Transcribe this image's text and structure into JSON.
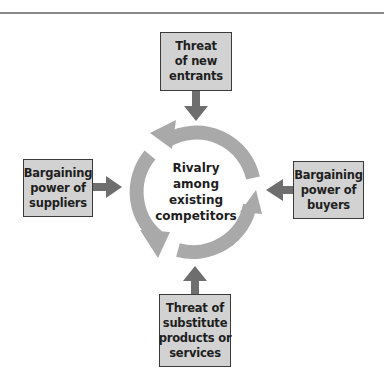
{
  "diagram": {
    "center": {
      "lines": [
        "Rivalry",
        "among",
        "existing",
        "competitors"
      ]
    },
    "forces": {
      "top": {
        "lines": [
          "Threat",
          "of new",
          "entrants"
        ]
      },
      "left": {
        "lines": [
          "Bargaining",
          "power of",
          "suppliers"
        ]
      },
      "right": {
        "lines": [
          "Bargaining",
          "power of",
          "buyers"
        ]
      },
      "bottom": {
        "lines": [
          "Threat of",
          "substitute",
          "products or",
          "services"
        ]
      }
    },
    "colors": {
      "box_fill": "#d2d2d2",
      "box_border": "#3a3a3a",
      "arrow": "#6e6e6e",
      "cycle_ring": "#a9a9a9",
      "text": "#1e1e1e",
      "rule": "#8a8a8a"
    }
  }
}
